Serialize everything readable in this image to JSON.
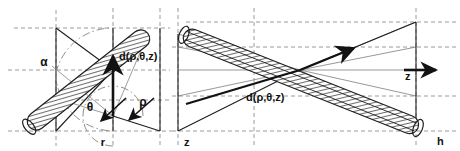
{
  "figure": {
    "width": 460,
    "height": 151,
    "background": "#ffffff",
    "line_color": "#1a1a1a",
    "dash_color": "#8c8c8c",
    "thin_color": "#7a7a7a",
    "hatch_color": "#4d4d4d",
    "panels": [
      {
        "name": "left-panel",
        "description": "End view: tilted hatched cylinder crossing the r-axis plane with angles alpha and theta"
      },
      {
        "name": "right-panel",
        "description": "Side view: tilted hatched cylinder along z with fan of rays converging at the detector point"
      }
    ]
  },
  "labels": {
    "alpha": "α",
    "theta": "θ",
    "rho": "ρ",
    "r": "r",
    "z_left": "z",
    "z_right": "z",
    "h": "h",
    "d_left": "d(ρ,θ,z)",
    "d_right": "d(ρ,θ,z)"
  },
  "label_positions": {
    "alpha": {
      "x": 44,
      "y": 66
    },
    "theta": {
      "x": 90,
      "y": 108
    },
    "rho": {
      "x": 141,
      "y": 106
    },
    "r": {
      "x": 103,
      "y": 145
    },
    "z_left": {
      "x": 184,
      "y": 145
    },
    "z_right": {
      "x": 422,
      "y": 79
    },
    "h": {
      "x": 441,
      "y": 143
    },
    "d_left": {
      "x": 119,
      "y": 59
    },
    "d_right": {
      "x": 246,
      "y": 98
    }
  },
  "arrows": {
    "rho_arrow": {
      "name": "rho-direction-arrow",
      "from": [
        113,
        116
      ],
      "to": [
        113,
        54
      ]
    },
    "theta_arrow": {
      "name": "theta-direction-arrow",
      "from": [
        124,
        100
      ],
      "to": [
        100,
        122
      ]
    },
    "rho_small_arrow": {
      "name": "rho-small-arrow",
      "from": [
        152,
        100
      ],
      "to": [
        128,
        119
      ]
    },
    "d_ray_arrow": {
      "name": "d-ray-arrow",
      "from": [
        288,
        80
      ],
      "to": [
        352,
        50
      ]
    },
    "z_axis_arrow": {
      "name": "z-axis-arrow",
      "from": [
        404,
        70
      ],
      "to": [
        438,
        70
      ]
    }
  },
  "geometry": {
    "left": {
      "frame_x": [
        56,
        160
      ],
      "frame_y": [
        28,
        131
      ],
      "axis_y": 70,
      "dash_v": [
        56,
        113,
        160
      ],
      "dash_h": [
        28,
        70,
        100,
        131
      ],
      "cylinder": {
        "start": [
          147,
          34
        ],
        "end": [
          30,
          126
        ],
        "half_width": 9
      },
      "arc_alpha": {
        "cx": 56,
        "cy": 131,
        "r": 58
      },
      "arc_theta": {
        "cx": 113,
        "cy": 116,
        "r": 30
      }
    },
    "right": {
      "frame_x": [
        178,
        416
      ],
      "frame_y": [
        22,
        131
      ],
      "axis_y": 70,
      "dash_h": [
        22,
        47,
        70,
        96,
        131
      ],
      "dash_v": [
        178,
        254,
        416
      ],
      "cylinder": {
        "start": [
          182,
          34
        ],
        "end": [
          418,
          128
        ],
        "half_width": 9
      },
      "fan_origin": [
        300,
        70
      ],
      "fan_targets": [
        [
          178,
          28
        ],
        [
          178,
          47
        ],
        [
          178,
          70
        ],
        [
          178,
          96
        ],
        [
          178,
          128
        ],
        [
          416,
          28
        ],
        [
          416,
          47
        ],
        [
          416,
          96
        ],
        [
          416,
          131
        ]
      ]
    }
  }
}
